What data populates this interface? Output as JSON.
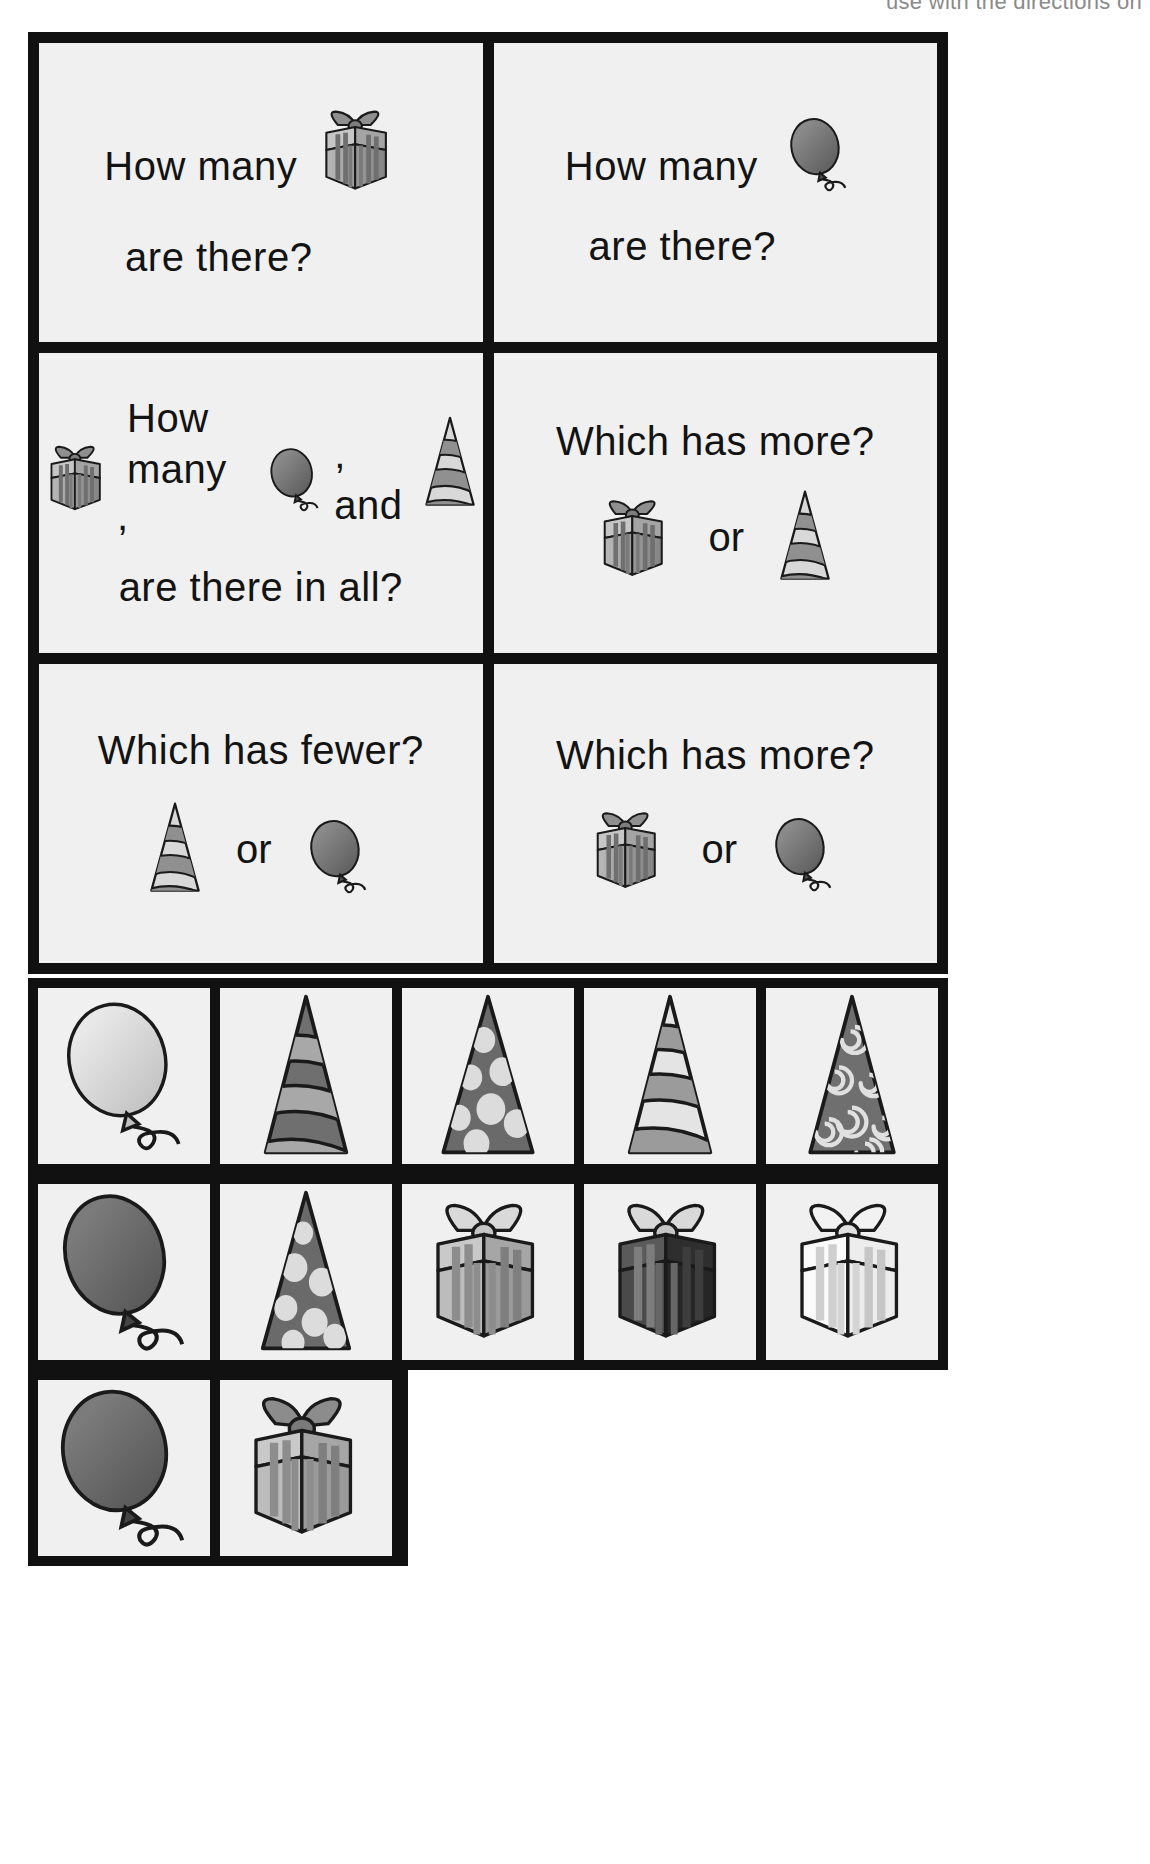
{
  "header": {
    "cut_off_text": "use with the directions on"
  },
  "question_cards": [
    {
      "id": "how-many-gift",
      "lines": [
        "How many",
        "are there?"
      ],
      "inline_icon": "gift-icon",
      "layout": "text-with-trailing-icon"
    },
    {
      "id": "how-many-balloon",
      "lines": [
        "How many",
        "are there?"
      ],
      "inline_icon": "balloon-icon",
      "layout": "text-with-trailing-icon"
    },
    {
      "id": "how-many-all-three",
      "lines": [
        "How many",
        ",",
        ", and",
        "are there in all?"
      ],
      "text_how_many": "How many",
      "comma_1": ",",
      "comma_and": ", and",
      "text_in_all": "are there in all?",
      "icons": [
        "gift-icon",
        "balloon-icon",
        "party-hat-icon"
      ],
      "layout": "three-icons-inline"
    },
    {
      "id": "which-has-more-gift-hat",
      "title": "Which has more?",
      "or_label": "or",
      "left_icon": "gift-icon",
      "right_icon": "party-hat-icon",
      "layout": "compare"
    },
    {
      "id": "which-has-fewer-hat-balloon",
      "title": "Which has fewer?",
      "or_label": "or",
      "left_icon": "party-hat-icon",
      "right_icon": "balloon-icon",
      "layout": "compare"
    },
    {
      "id": "which-has-more-gift-balloon",
      "title": "Which has more?",
      "or_label": "or",
      "left_icon": "gift-icon",
      "right_icon": "balloon-icon",
      "layout": "compare"
    }
  ],
  "picture_cards": {
    "row1": [
      {
        "id": "balloon-light",
        "icon": "balloon-icon",
        "shade": "light"
      },
      {
        "id": "hat-striped-dark",
        "icon": "party-hat-icon",
        "pattern": "stripes",
        "shade": "dark"
      },
      {
        "id": "hat-dots-dark",
        "icon": "party-hat-icon",
        "pattern": "dots",
        "shade": "dark"
      },
      {
        "id": "hat-striped-light",
        "icon": "party-hat-icon",
        "pattern": "stripes",
        "shade": "light"
      },
      {
        "id": "hat-swirls-dark",
        "icon": "party-hat-icon",
        "pattern": "swirls",
        "shade": "dark"
      }
    ],
    "row2": [
      {
        "id": "balloon-dark",
        "icon": "balloon-icon",
        "shade": "dark"
      },
      {
        "id": "hat-dots-dark-2",
        "icon": "party-hat-icon",
        "pattern": "dots",
        "shade": "dark"
      },
      {
        "id": "gift-gray",
        "icon": "gift-icon",
        "shade": "gray"
      },
      {
        "id": "gift-black",
        "icon": "gift-icon",
        "shade": "black"
      },
      {
        "id": "gift-white",
        "icon": "gift-icon",
        "shade": "white"
      }
    ],
    "row3": [
      {
        "id": "balloon-dark-2",
        "icon": "balloon-icon",
        "shade": "dark"
      },
      {
        "id": "gift-gray-2",
        "icon": "gift-icon",
        "shade": "gray"
      }
    ]
  },
  "colors": {
    "border": "#111111",
    "card_bg": "#eff0ef",
    "text": "#131313",
    "gray_light": "#d6d6d6",
    "gray_mid": "#9a9a9a",
    "gray_dark": "#6e6e6e",
    "gray_darker": "#4a4a4a",
    "near_black": "#2b2b2b",
    "header_gray": "#8a8a8a"
  }
}
